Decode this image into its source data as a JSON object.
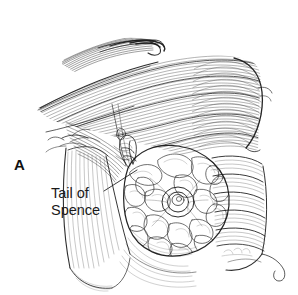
{
  "figure": {
    "type": "anatomical-line-illustration",
    "style": "pen-and-ink cross-hatch medical illustration",
    "background_color": "#ffffff",
    "ink_color": "#1a1a1a",
    "panel_letter": "A",
    "width": 298,
    "height": 295
  },
  "labels": {
    "callout": {
      "name": "tail-of-spence",
      "line1": "Tail of",
      "line2": "Spence",
      "text_color": "#1a1a1a",
      "x": 51,
      "y": 185,
      "leader_start_x": 104,
      "leader_start_y": 191,
      "leader_end_x": 137,
      "leader_end_y": 170
    }
  },
  "structures": [
    {
      "name": "pectoralis-major",
      "region": "upper-left-to-center",
      "rendering": "dense parallel fiber hatching"
    },
    {
      "name": "deltoid-shoulder",
      "region": "upper-right",
      "rendering": "curved contour with fiber hatching"
    },
    {
      "name": "axilla",
      "region": "center-left",
      "rendering": "converging hatch lines"
    },
    {
      "name": "axillary-tail-of-spence",
      "region": "center",
      "rendering": "lobular glandular extension"
    },
    {
      "name": "breast-glandular-tissue",
      "region": "center-lower",
      "rendering": "lobulated stippled mass"
    },
    {
      "name": "nipple-areola",
      "region": "center",
      "cx": 178,
      "cy": 202,
      "rendering": "concentric circular detail"
    },
    {
      "name": "serratus-anterior-ribs",
      "region": "right-lower",
      "rendering": "horizontal banded hatching"
    },
    {
      "name": "upper-arm",
      "region": "left-lower",
      "rendering": "long vertical hatch strokes"
    },
    {
      "name": "torso-contour",
      "region": "right-edge",
      "rendering": "single outline curve"
    }
  ]
}
